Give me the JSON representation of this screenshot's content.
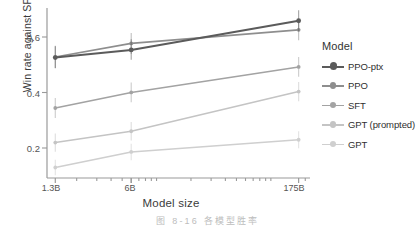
{
  "chart_data": {
    "type": "line",
    "title": "",
    "xlabel": "Model size",
    "ylabel": "Win rate against SFT 175B",
    "x": [
      "1.3B",
      "6B",
      "175B"
    ],
    "x_positions": [
      1.3,
      6,
      175
    ],
    "xscale": "log",
    "xlim": [
      1.1,
      220
    ],
    "ylim": [
      0.1,
      0.7
    ],
    "yticks": [
      0.2,
      0.4,
      0.6
    ],
    "ytick_labels": [
      "0.2",
      "0.4",
      "0.6"
    ],
    "grid": false,
    "legend_position": "right",
    "legend_title": "Model",
    "series": [
      {
        "name": "PPO-ptx",
        "color": "#5b5b5b",
        "values": [
          0.525,
          0.552,
          0.655
        ],
        "err_low": [
          0.487,
          0.517,
          0.618
        ],
        "err_high": [
          0.565,
          0.59,
          0.692
        ],
        "marker": "circle",
        "linewidth": 2.1
      },
      {
        "name": "PPO",
        "color": "#8e8e8e",
        "values": [
          0.527,
          0.575,
          0.623
        ],
        "err_low": [
          0.488,
          0.538,
          0.586
        ],
        "err_high": [
          0.567,
          0.612,
          0.66
        ],
        "marker": "circle",
        "linewidth": 1.7
      },
      {
        "name": "SFT",
        "color": "#a3a3a3",
        "values": [
          0.347,
          0.402,
          0.492
        ],
        "err_low": [
          0.312,
          0.367,
          0.457
        ],
        "err_high": [
          0.382,
          0.437,
          0.527
        ],
        "marker": "circle",
        "linewidth": 1.6
      },
      {
        "name": "GPT (prompted)",
        "color": "#c4c4c4",
        "values": [
          0.225,
          0.265,
          0.405
        ],
        "err_low": [
          0.193,
          0.232,
          0.371
        ],
        "err_high": [
          0.257,
          0.298,
          0.439
        ],
        "marker": "circle",
        "linewidth": 1.6
      },
      {
        "name": "GPT",
        "color": "#cfcfcf",
        "values": [
          0.137,
          0.192,
          0.235
        ],
        "err_low": [
          0.11,
          0.163,
          0.205
        ],
        "err_high": [
          0.164,
          0.221,
          0.265
        ],
        "marker": "circle",
        "linewidth": 1.6
      }
    ]
  },
  "legend": {
    "title": "Model",
    "entries": [
      {
        "label": "PPO-ptx",
        "color": "#5b5b5b"
      },
      {
        "label": "PPO",
        "color": "#8e8e8e"
      },
      {
        "label": "SFT",
        "color": "#a3a3a3"
      },
      {
        "label": "GPT (prompted)",
        "color": "#c4c4c4"
      },
      {
        "label": "GPT",
        "color": "#cfcfcf"
      }
    ]
  },
  "caption": {
    "text": "图 8-16 各模型胜率"
  },
  "colors": {
    "axis": "#999999",
    "tick_text": "#555555",
    "label_text": "#3b3b3b",
    "caption_text": "#bdbdbd",
    "background": "#ffffff"
  }
}
